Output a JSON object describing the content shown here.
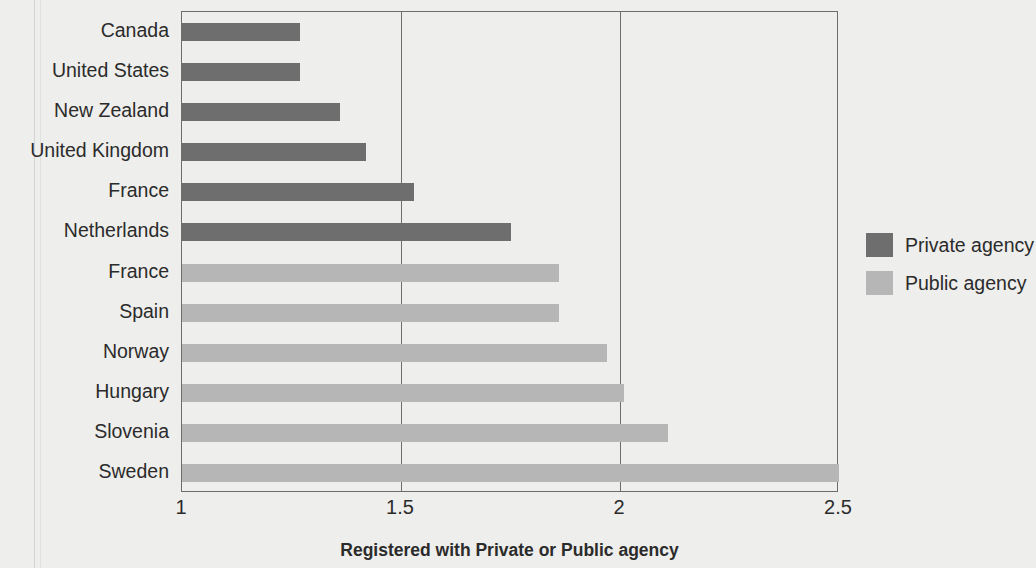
{
  "chart_data": {
    "type": "bar",
    "orientation": "horizontal",
    "title": "",
    "xlabel": "Registered with Private or Public agency",
    "ylabel": "",
    "xlim": [
      1,
      2.5
    ],
    "xticks": [
      "1",
      "1.5",
      "2",
      "2.5"
    ],
    "xtick_values": [
      1,
      1.5,
      2,
      2.5
    ],
    "grid": "vertical gridlines at 1.5 and 2",
    "legend_position": "right",
    "categories": [
      "Canada",
      "United States",
      "New Zealand",
      "United Kingdom",
      "France",
      "Netherlands",
      "France",
      "Spain",
      "Norway",
      "Hungary",
      "Slovenia",
      "Sweden"
    ],
    "values": [
      1.27,
      1.27,
      1.36,
      1.42,
      1.53,
      1.75,
      1.86,
      1.86,
      1.97,
      2.01,
      2.11,
      2.5
    ],
    "groups": [
      "Private agency",
      "Private agency",
      "Private agency",
      "Private agency",
      "Private agency",
      "Private agency",
      "Public agency",
      "Public agency",
      "Public agency",
      "Public agency",
      "Public agency",
      "Public agency"
    ],
    "series": [
      {
        "name": "Private agency",
        "color": "#6e6e6e",
        "points": [
          {
            "category": "Canada",
            "value": 1.27
          },
          {
            "category": "United States",
            "value": 1.27
          },
          {
            "category": "New Zealand",
            "value": 1.36
          },
          {
            "category": "United Kingdom",
            "value": 1.42
          },
          {
            "category": "France",
            "value": 1.53
          },
          {
            "category": "Netherlands",
            "value": 1.75
          }
        ]
      },
      {
        "name": "Public agency",
        "color": "#b6b6b6",
        "points": [
          {
            "category": "France",
            "value": 1.86
          },
          {
            "category": "Spain",
            "value": 1.86
          },
          {
            "category": "Norway",
            "value": 1.97
          },
          {
            "category": "Hungary",
            "value": 2.01
          },
          {
            "category": "Slovenia",
            "value": 2.11
          },
          {
            "category": "Sweden",
            "value": 2.5
          }
        ]
      }
    ]
  },
  "legend": {
    "items": [
      {
        "label": "Private agency",
        "color": "#6e6e6e",
        "kind": "private"
      },
      {
        "label": "Public agency",
        "color": "#b6b6b6",
        "kind": "public"
      }
    ]
  },
  "axis": {
    "x_title": "Registered with Private or Public agency",
    "ticks": [
      "1",
      "1.5",
      "2",
      "2.5"
    ]
  },
  "colors": {
    "private": "#6e6e6e",
    "public": "#b6b6b6",
    "axis": "#6d6d6d",
    "text": "#2b2b2b",
    "background": "#eeeeec"
  }
}
